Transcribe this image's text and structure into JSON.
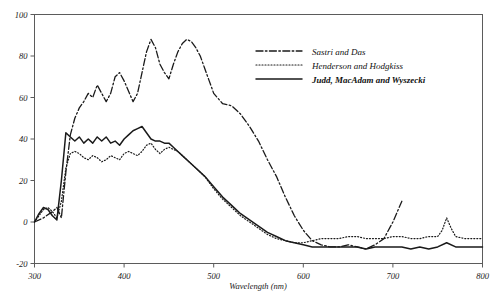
{
  "chart_data": {
    "type": "line",
    "title": "",
    "xlabel": "Wavelength (nm)",
    "ylabel": "",
    "xlim": [
      300,
      800
    ],
    "ylim": [
      -20,
      100
    ],
    "xticks": [
      300,
      400,
      500,
      600,
      700,
      800
    ],
    "yticks": [
      -20,
      0,
      20,
      40,
      60,
      80,
      100
    ],
    "grid": false,
    "legend_position": "upper-right",
    "series": [
      {
        "name": "Sastri and Das",
        "style": "dashdot",
        "x": [
          300,
          310,
          320,
          325,
          330,
          335,
          340,
          345,
          350,
          355,
          360,
          365,
          370,
          375,
          380,
          385,
          390,
          395,
          400,
          405,
          410,
          415,
          420,
          425,
          430,
          435,
          440,
          445,
          450,
          455,
          460,
          465,
          470,
          475,
          480,
          485,
          490,
          495,
          500,
          510,
          520,
          530,
          540,
          550,
          560,
          570,
          580,
          590,
          600,
          610,
          620,
          630,
          640,
          650,
          660,
          670,
          680,
          690,
          700,
          710
        ],
        "y": [
          0,
          2,
          5,
          7,
          2,
          24,
          42,
          50,
          55,
          58,
          62,
          60,
          66,
          62,
          58,
          62,
          70,
          72,
          68,
          63,
          58,
          62,
          72,
          82,
          88,
          84,
          76,
          72,
          69,
          76,
          82,
          86,
          88,
          87,
          84,
          80,
          74,
          68,
          62,
          57,
          56,
          52,
          46,
          39,
          30,
          22,
          12,
          3,
          -4,
          -9,
          -11,
          -12,
          -12,
          -11,
          -12,
          -13,
          -11,
          -8,
          0,
          10
        ]
      },
      {
        "name": "Henderson and Hodgkiss",
        "style": "dotted",
        "x": [
          300,
          305,
          310,
          315,
          320,
          325,
          330,
          335,
          340,
          345,
          350,
          355,
          360,
          365,
          370,
          375,
          380,
          385,
          390,
          395,
          400,
          405,
          410,
          415,
          420,
          425,
          430,
          435,
          440,
          445,
          450,
          455,
          460,
          465,
          470,
          480,
          490,
          500,
          510,
          520,
          530,
          540,
          550,
          560,
          570,
          580,
          590,
          600,
          610,
          620,
          630,
          640,
          650,
          660,
          670,
          680,
          690,
          700,
          710,
          720,
          730,
          740,
          750,
          755,
          760,
          765,
          770,
          780,
          790,
          800
        ],
        "y": [
          0,
          3,
          6,
          7,
          5,
          2,
          10,
          26,
          33,
          34,
          33,
          31,
          30,
          32,
          31,
          29,
          30,
          32,
          31,
          30,
          33,
          34,
          33,
          32,
          34,
          37,
          38,
          35,
          33,
          35,
          36,
          35,
          34,
          32,
          30,
          26,
          22,
          16,
          11,
          7,
          3,
          0,
          -3,
          -6,
          -8,
          -9,
          -10,
          -10,
          -9,
          -8,
          -8,
          -8,
          -7,
          -7,
          -8,
          -8,
          -8,
          -7,
          -7,
          -8,
          -8,
          -7,
          -7,
          -4,
          2,
          -3,
          -7,
          -8,
          -8,
          -8
        ]
      },
      {
        "name": "Judd, MacAdam and Wyszecki",
        "style": "solid",
        "x": [
          300,
          305,
          310,
          315,
          320,
          325,
          330,
          335,
          340,
          345,
          350,
          355,
          360,
          365,
          370,
          375,
          380,
          385,
          390,
          395,
          400,
          405,
          410,
          415,
          420,
          425,
          430,
          435,
          440,
          445,
          450,
          455,
          460,
          465,
          470,
          480,
          490,
          500,
          510,
          520,
          530,
          540,
          550,
          560,
          570,
          580,
          590,
          600,
          610,
          620,
          630,
          640,
          650,
          660,
          670,
          680,
          690,
          700,
          710,
          720,
          730,
          740,
          750,
          760,
          770,
          780,
          790,
          800
        ],
        "y": [
          0,
          4,
          7,
          6,
          3,
          1,
          20,
          43,
          41,
          39,
          41,
          38,
          40,
          38,
          41,
          39,
          41,
          38,
          39,
          37,
          40,
          42,
          44,
          45,
          46,
          43,
          40,
          39,
          39,
          38,
          38,
          36,
          34,
          32,
          30,
          26,
          22,
          17,
          12,
          8,
          4,
          1,
          -2,
          -5,
          -7,
          -9,
          -10,
          -11,
          -12,
          -12,
          -12,
          -12,
          -12,
          -12,
          -13,
          -12,
          -12,
          -12,
          -12,
          -13,
          -12,
          -13,
          -12,
          -10,
          -12,
          -12,
          -12,
          -12
        ]
      }
    ]
  },
  "axes": {
    "x_tick_labels": [
      "300",
      "400",
      "500",
      "600",
      "700",
      "800"
    ],
    "y_tick_labels": [
      "-20",
      "0",
      "20",
      "40",
      "60",
      "80",
      "100"
    ],
    "x_axis_title": "Wavelength (nm)"
  },
  "legend": {
    "entries": [
      {
        "label": "Sastri and Das",
        "style": "dashdot"
      },
      {
        "label": "Henderson and Hodgkiss",
        "style": "dotted"
      },
      {
        "label": "Judd, MacAdam and Wyszecki",
        "style": "solid"
      }
    ]
  },
  "colors": {
    "ink": "#1a1a1a",
    "axis": "#5b5b5b",
    "background": "#ffffff"
  }
}
